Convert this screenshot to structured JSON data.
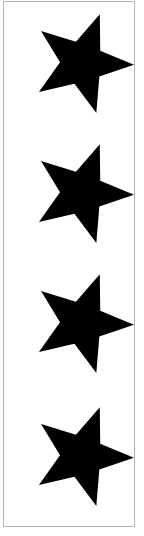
{
  "image": {
    "title": "Four black stars in a vertical column",
    "description": "A tall narrow white panel with a thin light gray rectangular border containing four identical solid black five-pointed stars stacked vertically, each rotated slightly clockwise.",
    "width": 144,
    "height": 536,
    "background_color": "#ffffff"
  },
  "frame": {
    "border_color": "#b4b4b4",
    "fill_color": "#ffffff",
    "border_width": 1,
    "x": 3,
    "y": 1,
    "width": 132,
    "height": 526
  },
  "shape": {
    "name": "five-pointed-star",
    "fill_color": "#000000",
    "points": 5,
    "rotation_degrees": 20,
    "outer_radius": 52,
    "inner_radius": 22,
    "count": 4
  },
  "stars": [
    {
      "label": "star-1",
      "order": 1,
      "center_x": 81,
      "center_y": 62,
      "rotation_degrees": 20
    },
    {
      "label": "star-2",
      "order": 2,
      "center_x": 81,
      "center_y": 192,
      "rotation_degrees": 20
    },
    {
      "label": "star-3",
      "order": 3,
      "center_x": 81,
      "center_y": 322,
      "rotation_degrees": 20
    },
    {
      "label": "star-4",
      "order": 4,
      "center_x": 81,
      "center_y": 455,
      "rotation_degrees": 20
    }
  ]
}
